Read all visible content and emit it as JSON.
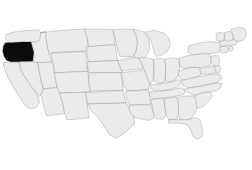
{
  "figure": {
    "kind": "choropleth-map",
    "region": "Contiguous United States",
    "width": 252,
    "height": 170,
    "background_color": "#ffffff"
  },
  "styles": {
    "state_fill": "#ebebeb",
    "state_border": "#8a8a8a",
    "highlight_fill": "#0b0b0b",
    "highlight_border": "#0b0b0b",
    "border_width": 0.55
  },
  "highlight": {
    "state_code": "OR",
    "state_name": "Oregon",
    "fill": "#0b0b0b",
    "selected": true
  },
  "chart_data": {
    "type": "map",
    "title": "",
    "subtitle": "",
    "xlabel": "",
    "ylabel": "",
    "legend": [],
    "annotations": [],
    "grid": false,
    "projection": "albers-usa",
    "value_field": "selected",
    "values": {
      "OR": 1,
      "WA": 0,
      "ID": 0,
      "MT": 0,
      "ND": 0,
      "MN": 0,
      "WI": 0,
      "MI": 0,
      "CA": 0,
      "NV": 0,
      "UT": 0,
      "WY": 0,
      "SD": 0,
      "IA": 0,
      "IL": 0,
      "AZ": 0,
      "CO": 0,
      "NE": 0,
      "KS": 0,
      "MO": 0,
      "IN": 0,
      "OH": 0,
      "NM": 0,
      "OK": 0,
      "AR": 0,
      "KY": 0,
      "WV": 0,
      "PA": 0,
      "NY": 0,
      "TX": 0,
      "LA": 0,
      "MS": 0,
      "AL": 0,
      "TN": 0,
      "VA": 0,
      "NC": 0,
      "SC": 0,
      "GA": 0,
      "FL": 0,
      "MD": 0,
      "DE": 0,
      "NJ": 0,
      "CT": 0,
      "RI": 0,
      "MA": 0,
      "VT": 0,
      "NH": 0,
      "ME": 0
    },
    "color_scale": {
      "0": "#ebebeb",
      "1": "#0b0b0b"
    }
  },
  "states": [
    {
      "code": "WA",
      "name": "Washington",
      "selected": false,
      "d": "M10,11 L22,8 L40,6 L57,5 L60,9 L60,22 L46,23 L30,24 L16,25 L12,22 L8,18 Z"
    },
    {
      "code": "OR",
      "name": "Oregon",
      "selected": true,
      "d": "M8,24 L18,24 L32,23 L46,23 L48,31 L50,38 L49,44 L48,51 L30,52 L16,52 L10,50 L6,44 L4,36 L5,29 Z"
    },
    {
      "code": "CA",
      "name": "California",
      "selected": false,
      "d": "M5,53 L16,53 L28,53 L30,61 L34,70 L40,79 L46,88 L52,96 L56,104 L58,112 L54,118 L47,121 L40,119 L34,112 L28,103 L22,93 L16,83 L11,73 L7,63 Z"
    },
    {
      "code": "NV",
      "name": "Nevada",
      "selected": false,
      "d": "M30,52 L49,52 L55,52 L58,68 L61,82 L64,95 L58,103 L52,96 L46,88 L40,79 L34,70 L30,61 Z"
    },
    {
      "code": "ID",
      "name": "Idaho",
      "selected": false,
      "d": "M46,23 L58,21 L60,9 L67,8 L68,20 L70,32 L73,42 L76,52 L64,53 L56,53 L49,52 L50,38 L48,31 Z"
    },
    {
      "code": "MT",
      "name": "Montana",
      "selected": false,
      "d": "M60,9 L80,7 L102,5 L124,4 L128,16 L130,30 L128,36 L106,37 L86,38 L76,39 L73,42 L70,32 L68,20 L67,8 Z"
    },
    {
      "code": "WY",
      "name": "Wyoming",
      "selected": false,
      "d": "M76,39 L100,38 L122,37 L126,38 L128,58 L129,66 L106,67 L86,68 L80,68 L78,56 L76,46 Z"
    },
    {
      "code": "UT",
      "name": "Utah",
      "selected": false,
      "d": "M56,53 L64,53 L76,52 L78,56 L80,68 L82,80 L84,90 L70,91 L64,92 L61,82 L58,68 Z"
    },
    {
      "code": "AZ",
      "name": "Arizona",
      "selected": false,
      "d": "M64,92 L70,91 L84,90 L88,90 L92,112 L95,128 L80,130 L68,131 L63,113 L60,100 Z"
    },
    {
      "code": "CO",
      "name": "Colorado",
      "selected": false,
      "d": "M80,68 L106,67 L129,66 L131,88 L133,96 L108,97 L88,98 L84,90 L82,80 Z"
    },
    {
      "code": "NM",
      "name": "New Mexico",
      "selected": false,
      "d": "M88,98 L108,97 L126,97 L129,120 L131,134 L114,136 L98,137 L95,128 L92,112 Z"
    },
    {
      "code": "ND",
      "name": "North Dakota",
      "selected": false,
      "d": "M124,4 L146,4 L166,5 L168,18 L169,27 L148,28 L130,30 L128,16 Z"
    },
    {
      "code": "SD",
      "name": "South Dakota",
      "selected": false,
      "d": "M128,30 L148,28 L169,27 L171,40 L173,50 L150,51 L130,52 L128,44 Z"
    },
    {
      "code": "NE",
      "name": "Nebraska",
      "selected": false,
      "d": "M129,52 L150,51 L173,50 L176,58 L180,66 L177,68 L154,68 L131,68 L129,62 Z"
    },
    {
      "code": "KS",
      "name": "Kansas",
      "selected": false,
      "d": "M131,68 L154,68 L178,68 L180,86 L181,94 L157,94 L133,95 L131,86 Z"
    },
    {
      "code": "OK",
      "name": "Oklahoma",
      "selected": false,
      "d": "M126,97 L146,96 L158,95 L181,94 L183,104 L185,112 L162,113 L142,113 L129,114 L127,105 Z"
    },
    {
      "code": "TX",
      "name": "Texas",
      "selected": false,
      "d": "M129,114 L150,113 L172,113 L186,112 L190,122 L196,132 L198,142 L192,148 L186,154 L178,160 L170,164 L162,160 L156,152 L150,142 L144,134 L138,128 L132,122 L131,118 Z"
    },
    {
      "code": "MN",
      "name": "Minnesota",
      "selected": false,
      "d": "M166,5 L182,4 L196,4 L200,14 L202,24 L200,36 L196,44 L176,44 L173,36 L171,26 L169,16 Z"
    },
    {
      "code": "IA",
      "name": "Iowa",
      "selected": false,
      "d": "M173,50 L192,46 L204,46 L208,54 L210,62 L190,64 L178,65 L176,58 Z"
    },
    {
      "code": "MO",
      "name": "Missouri",
      "selected": false,
      "d": "M178,68 L196,66 L212,64 L216,74 L220,84 L218,92 L204,94 L186,94 L181,86 L180,76 Z"
    },
    {
      "code": "AR",
      "name": "Arkansas",
      "selected": false,
      "d": "M185,95 L203,94 L218,93 L220,104 L222,114 L206,115 L190,115 L186,106 Z"
    },
    {
      "code": "LA",
      "name": "Louisiana",
      "selected": false,
      "d": "M190,116 L206,115 L222,115 L225,126 L226,134 L218,138 L208,136 L198,134 L192,128 L190,122 Z"
    },
    {
      "code": "WI",
      "name": "Wisconsin",
      "selected": false,
      "d": "M196,4 L212,8 L218,18 L220,28 L218,38 L212,46 L202,47 L196,44 L200,36 L202,24 L200,14 Z"
    },
    {
      "code": "IL",
      "name": "Illinois",
      "selected": false,
      "d": "M204,46 L216,46 L224,48 L226,58 L226,70 L224,80 L220,86 L216,74 L212,64 L208,54 Z"
    },
    {
      "code": "MI",
      "name": "Michigan",
      "selected": false,
      "d": "M214,8 L228,6 L242,10 L248,18 L250,28 L246,36 L238,42 L230,44 L226,38 L224,28 L220,18 Z"
    },
    {
      "code": "IN",
      "name": "Indiana",
      "selected": false,
      "d": "M226,48 L236,47 L242,48 L243,60 L243,72 L241,82 L232,84 L226,80 L226,68 L226,58 Z"
    },
    {
      "code": "OH",
      "name": "Ohio",
      "selected": false,
      "d": "M243,48 L254,46 L262,48 L264,58 L263,70 L258,78 L248,82 L243,80 L243,68 L243,58 Z"
    },
    {
      "code": "KY",
      "name": "Kentucky",
      "selected": false,
      "d": "M222,86 L236,84 L250,82 L262,78 L266,82 L262,88 L252,92 L240,94 L228,95 L222,92 Z"
    },
    {
      "code": "TN",
      "name": "Tennessee",
      "selected": false,
      "d": "M220,96 L236,95 L252,93 L266,90 L272,94 L270,100 L256,103 L240,105 L224,106 L220,102 Z"
    },
    {
      "code": "MS",
      "name": "Mississippi",
      "selected": false,
      "d": "M222,107 L234,106 L240,106 L242,118 L244,130 L240,136 L230,136 L226,128 L224,118 Z"
    },
    {
      "code": "AL",
      "name": "Alabama",
      "selected": false,
      "d": "M242,106 L254,104 L260,104 L262,116 L262,128 L260,136 L248,137 L244,130 L242,118 Z"
    },
    {
      "code": "GA",
      "name": "Georgia",
      "selected": false,
      "d": "M262,104 L276,102 L286,102 L290,112 L288,124 L282,134 L274,138 L264,137 L262,128 L262,116 Z"
    },
    {
      "code": "FL",
      "name": "Florida",
      "selected": false,
      "d": "M248,137 L264,137 L276,137 L288,134 L294,138 L296,146 L298,154 L296,162 L290,166 L284,162 L280,152 L274,144 L264,142 L254,142 L248,142 Z"
    },
    {
      "code": "SC",
      "name": "South Carolina",
      "selected": false,
      "d": "M286,101 L298,97 L308,96 L312,102 L306,110 L298,118 L290,120 L288,112 Z"
    },
    {
      "code": "NC",
      "name": "North Carolina",
      "selected": false,
      "d": "M270,92 L286,89 L302,86 L318,83 L326,84 L322,92 L312,96 L298,97 L286,101 L274,96 Z"
    },
    {
      "code": "VA",
      "name": "Virginia",
      "selected": false,
      "d": "M266,80 L280,76 L296,73 L312,70 L322,70 L326,76 L320,82 L306,85 L292,88 L276,90 L268,86 Z"
    },
    {
      "code": "WV",
      "name": "West Virginia",
      "selected": false,
      "d": "M262,66 L272,62 L282,60 L292,60 L296,66 L294,72 L284,75 L274,78 L266,78 L262,72 Z"
    },
    {
      "code": "PA",
      "name": "Pennsylvania",
      "selected": false,
      "d": "M264,46 L280,42 L296,40 L308,40 L310,50 L308,58 L296,60 L282,60 L270,62 L264,58 Z"
    },
    {
      "code": "MD",
      "name": "Maryland",
      "selected": false,
      "d": "M294,62 L306,60 L316,58 L320,62 L316,68 L306,70 L296,70 L294,66 Z"
    },
    {
      "code": "DE",
      "name": "Delaware",
      "selected": false,
      "d": "M316,58 L322,57 L324,62 L322,68 L318,68 L316,64 Z"
    },
    {
      "code": "NJ",
      "name": "New Jersey",
      "selected": false,
      "d": "M310,44 L318,42 L322,46 L322,54 L318,58 L312,57 L310,50 Z"
    },
    {
      "code": "NY",
      "name": "New York",
      "selected": false,
      "d": "M278,28 L294,24 L310,22 L322,24 L326,30 L322,38 L310,40 L296,40 L282,42 L276,38 Z"
    },
    {
      "code": "CT",
      "name": "Connecticut",
      "selected": false,
      "d": "M324,30 L332,29 L336,32 L334,38 L326,39 L323,35 Z"
    },
    {
      "code": "RI",
      "name": "Rhode Island",
      "selected": false,
      "d": "M336,30 L341,29 L342,34 L338,37 L336,34 Z"
    },
    {
      "code": "MA",
      "name": "Massachusetts",
      "selected": false,
      "d": "M322,22 L334,20 L344,19 L350,22 L346,27 L336,28 L324,29 Z"
    },
    {
      "code": "VT",
      "name": "Vermont",
      "selected": false,
      "d": "M318,10 L326,8 L330,12 L329,20 L324,22 L318,20 Z"
    },
    {
      "code": "NH",
      "name": "New Hampshire",
      "selected": false,
      "d": "M330,9 L338,7 L342,12 L341,20 L335,22 L330,19 Z"
    },
    {
      "code": "ME",
      "name": "Maine",
      "selected": false,
      "d": "M340,4 L352,1 L360,4 L362,12 L358,20 L350,22 L344,20 L342,12 Z"
    }
  ]
}
